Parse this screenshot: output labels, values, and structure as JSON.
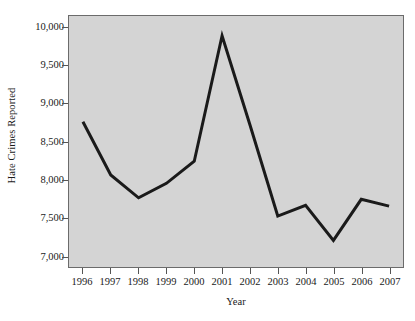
{
  "chart_data": {
    "type": "line",
    "title": "",
    "xlabel": "Year",
    "ylabel": "Hate Crimes Reported",
    "categories": [
      "1996",
      "1997",
      "1998",
      "1999",
      "2000",
      "2001",
      "2002",
      "2003",
      "2004",
      "2005",
      "2006",
      "2007"
    ],
    "x": [
      1996,
      1997,
      1998,
      1999,
      2000,
      2001,
      2002,
      2003,
      2004,
      2005,
      2006,
      2007
    ],
    "values": [
      8760,
      8060,
      7760,
      7950,
      8240,
      9890,
      8720,
      7520,
      7660,
      7200,
      7740,
      7650
    ],
    "series": [
      {
        "name": "Hate Crimes Reported",
        "values": [
          8760,
          8060,
          7760,
          7950,
          8240,
          9890,
          8720,
          7520,
          7660,
          7200,
          7740,
          7650
        ]
      }
    ],
    "ylim": [
      6850,
      10150
    ],
    "xlim": [
      1995.5,
      2007.5
    ],
    "yticks": [
      7000,
      7500,
      8000,
      8500,
      9000,
      9500,
      10000
    ],
    "ytick_labels": [
      "7,000",
      "7,500",
      "8,000",
      "8,500",
      "9,000",
      "9,500",
      "10,000"
    ],
    "grid": false,
    "legend": false,
    "line_color": "#1a1a1a",
    "plot_background": "#d4d4d4",
    "frame_color": "#6b6b6b",
    "figure_background": "#ffffff"
  }
}
